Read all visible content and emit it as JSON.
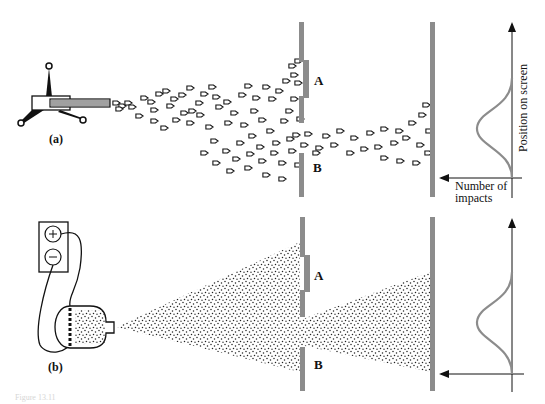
{
  "figure": {
    "panels": [
      {
        "id": "a",
        "label": "(a)",
        "source": "machine-gun",
        "particle": "bullet",
        "slit_top_label": "A",
        "slit_bottom_label": "B",
        "axis_vertical_label": "Position on screen",
        "axis_horizontal_label_line1": "Number of",
        "axis_horizontal_label_line2": "impacts"
      },
      {
        "id": "b",
        "label": "(b)",
        "source": "electron-gun-with-battery",
        "particle": "electron",
        "slit_top_label": "A",
        "slit_bottom_label": "B",
        "battery_plus": "+",
        "battery_minus": "−"
      }
    ],
    "caption": "Figure 13.11",
    "colors": {
      "barrier": "#8c8c8c",
      "curve": "#8c8c8c",
      "ink": "#111111",
      "background": "#ffffff"
    }
  }
}
